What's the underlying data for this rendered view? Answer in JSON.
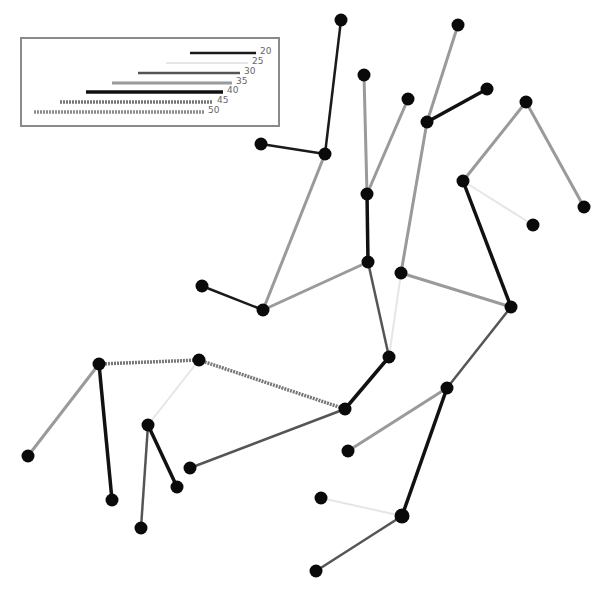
{
  "diagram": {
    "type": "tree-network",
    "legend": {
      "items": [
        {
          "label": "20",
          "style": "s20"
        },
        {
          "label": "25",
          "style": "s25"
        },
        {
          "label": "30",
          "style": "s30"
        },
        {
          "label": "35",
          "style": "s35"
        },
        {
          "label": "40",
          "style": "s40"
        },
        {
          "label": "45",
          "style": "s45"
        },
        {
          "label": "50",
          "style": "s50"
        }
      ]
    },
    "styles": {
      "s20": {
        "color": "#1a1a1a",
        "width": 2.5,
        "dash": ""
      },
      "s25": {
        "color": "#e6e6e6",
        "width": 2,
        "dash": ""
      },
      "s30": {
        "color": "#555555",
        "width": 2.5,
        "dash": ""
      },
      "s35": {
        "color": "#9a9a9a",
        "width": 3,
        "dash": ""
      },
      "s40": {
        "color": "#111111",
        "width": 3.5,
        "dash": ""
      },
      "s45": {
        "color": "#777777",
        "width": 3.5,
        "dash": "2 1"
      },
      "s50": {
        "color": "#8c8c8c",
        "width": 3.5,
        "dash": "2 1"
      }
    },
    "nodes": {
      "A": [
        341,
        20
      ],
      "B": [
        261,
        144
      ],
      "C": [
        325,
        154
      ],
      "D": [
        364,
        75
      ],
      "E": [
        408,
        99
      ],
      "F": [
        367,
        194
      ],
      "G": [
        458,
        25
      ],
      "H": [
        487,
        89
      ],
      "I": [
        427,
        122
      ],
      "J": [
        526,
        102
      ],
      "K": [
        584,
        207
      ],
      "L": [
        463,
        181
      ],
      "M": [
        533,
        225
      ],
      "N": [
        202,
        286
      ],
      "O": [
        263,
        310
      ],
      "P": [
        368,
        262
      ],
      "Q": [
        401,
        273
      ],
      "R": [
        511,
        307
      ],
      "S": [
        389,
        357
      ],
      "T": [
        99,
        364
      ],
      "U": [
        199,
        360
      ],
      "V": [
        345,
        409
      ],
      "W": [
        447,
        388
      ],
      "X": [
        28,
        456
      ],
      "Y": [
        148,
        425
      ],
      "Z": [
        112,
        500
      ],
      "AA": [
        177,
        487
      ],
      "AB": [
        141,
        528
      ],
      "AC": [
        190,
        468
      ],
      "AD": [
        348,
        451
      ],
      "AE": [
        321,
        498
      ],
      "AF": [
        402,
        516
      ],
      "AG": [
        316,
        571
      ]
    },
    "edges": [
      [
        "A",
        "C",
        "s20"
      ],
      [
        "B",
        "C",
        "s20"
      ],
      [
        "C",
        "O",
        "s35"
      ],
      [
        "D",
        "F",
        "s35"
      ],
      [
        "E",
        "F",
        "s35"
      ],
      [
        "F",
        "P",
        "s40"
      ],
      [
        "P",
        "O",
        "s35"
      ],
      [
        "N",
        "O",
        "s20"
      ],
      [
        "P",
        "S",
        "s30"
      ],
      [
        "G",
        "I",
        "s35"
      ],
      [
        "I",
        "H",
        "s40"
      ],
      [
        "I",
        "Q",
        "s35"
      ],
      [
        "Q",
        "S",
        "s25"
      ],
      [
        "Q",
        "R",
        "s35"
      ],
      [
        "L",
        "J",
        "s35"
      ],
      [
        "J",
        "K",
        "s35"
      ],
      [
        "L",
        "M",
        "s25"
      ],
      [
        "L",
        "R",
        "s40"
      ],
      [
        "R",
        "W",
        "s30"
      ],
      [
        "W",
        "AD",
        "s35"
      ],
      [
        "W",
        "AF",
        "s40"
      ],
      [
        "AF",
        "AE",
        "s25"
      ],
      [
        "AF",
        "AG",
        "s30"
      ],
      [
        "S",
        "V",
        "s40"
      ],
      [
        "U",
        "V",
        "s45"
      ],
      [
        "AC",
        "V",
        "s30"
      ],
      [
        "T",
        "U",
        "s45"
      ],
      [
        "T",
        "X",
        "s35"
      ],
      [
        "T",
        "Z",
        "s40"
      ],
      [
        "U",
        "Y",
        "s25"
      ],
      [
        "Y",
        "AB",
        "s30"
      ],
      [
        "Y",
        "AA",
        "s40"
      ]
    ],
    "node_color": "#0a0a0a",
    "node_radius": 6.5
  }
}
